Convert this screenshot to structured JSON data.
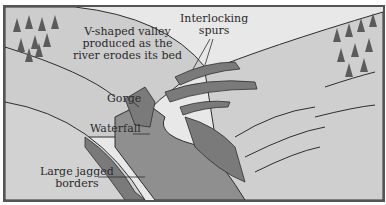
{
  "diagram": {
    "labels": {
      "v_valley": [
        "V-shaped valley",
        "produced as the",
        "river erodes its bed"
      ],
      "interlocking_spurs": [
        "Interlocking",
        "spurs"
      ],
      "gorge": "Gorge",
      "waterfall": "Waterfall",
      "jagged_borders": [
        "Large jagged",
        "borders"
      ]
    },
    "colors": {
      "sky": "#e6e6e6",
      "land": "#c9c9c9",
      "water": "#8c8c8c",
      "rock": "#7e7e7e",
      "line": "#2e2e2e",
      "tree": "#5b5b5b"
    }
  }
}
